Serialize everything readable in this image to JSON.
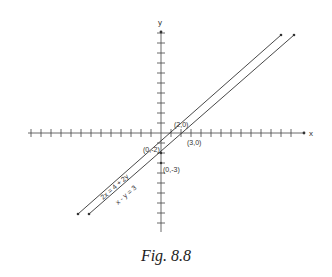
{
  "diagram": {
    "axes": {
      "x_label": "x",
      "y_label": "y",
      "x_ticks_range": [
        -13,
        13
      ],
      "y_ticks_range": [
        -9,
        10
      ]
    },
    "lines": [
      {
        "equation": "2x = 4 + 2y",
        "x_intercept_label": "(2,0)",
        "y_intercept_label": "(0,-2)"
      },
      {
        "equation": "x - y = 3",
        "x_intercept_label": "(3,0)",
        "y_intercept_label": "(0,-3)"
      }
    ],
    "caption": "Fig. 8.8"
  },
  "colors": {
    "ink": "#333333",
    "background": "#ffffff"
  }
}
